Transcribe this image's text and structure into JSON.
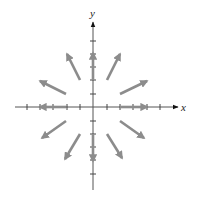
{
  "diagram": {
    "type": "vector-field",
    "axes": {
      "x_label": "x",
      "y_label": "y",
      "origin_px": [
        93,
        107
      ],
      "tick_spacing_px": 13.4,
      "x_ticks_px": [
        27,
        40,
        53,
        67,
        80,
        107,
        120,
        133,
        147,
        160
      ],
      "y_ticks_px": [
        41,
        54,
        67,
        80,
        94,
        121,
        134,
        147,
        160,
        174
      ],
      "x_range_px": [
        15,
        180
      ],
      "y_range_px": [
        22,
        190
      ]
    },
    "colors": {
      "axis": "#333333",
      "tick": "#444444",
      "vector": "#8c8c8c",
      "axis_arrow": "#111111"
    },
    "vectors": [
      {
        "from": [
          120,
          107
        ],
        "to": [
          147,
          107
        ],
        "name": "vector-east"
      },
      {
        "from": [
          66,
          107
        ],
        "to": [
          40,
          107
        ],
        "name": "vector-west"
      },
      {
        "from": [
          93,
          80
        ],
        "to": [
          93,
          53
        ],
        "name": "vector-north"
      },
      {
        "from": [
          93,
          134
        ],
        "to": [
          93,
          161
        ],
        "name": "vector-south"
      },
      {
        "from": [
          107,
          80
        ],
        "to": [
          120,
          54
        ],
        "name": "vector-nne"
      },
      {
        "from": [
          120,
          94
        ],
        "to": [
          147,
          81
        ],
        "name": "vector-ene"
      },
      {
        "from": [
          80,
          80
        ],
        "to": [
          67,
          54
        ],
        "name": "vector-nnw"
      },
      {
        "from": [
          66,
          94
        ],
        "to": [
          40,
          81
        ],
        "name": "vector-wnw"
      },
      {
        "from": [
          66,
          121
        ],
        "to": [
          42,
          138
        ],
        "name": "vector-wsw"
      },
      {
        "from": [
          80,
          134
        ],
        "to": [
          65,
          159
        ],
        "name": "vector-ssw"
      },
      {
        "from": [
          120,
          121
        ],
        "to": [
          144,
          138
        ],
        "name": "vector-ese"
      },
      {
        "from": [
          107,
          134
        ],
        "to": [
          122,
          158
        ],
        "name": "vector-sse"
      }
    ]
  }
}
